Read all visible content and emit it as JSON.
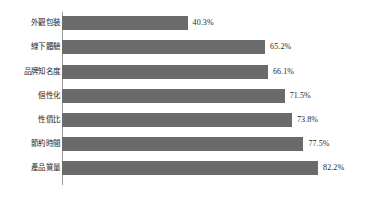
{
  "chart_data": {
    "type": "bar",
    "orientation": "horizontal",
    "title": "",
    "subtitle": "",
    "xlabel": "",
    "ylabel": "",
    "grid": false,
    "legend": null,
    "legend_position": "none",
    "xlim": [
      0,
      100
    ],
    "value_suffix": "%",
    "categories": [
      "外觀包裝",
      "線下體驗",
      "品牌知名度",
      "個性化",
      "性價比",
      "節約時間",
      "產品質量"
    ],
    "values": [
      40.3,
      65.2,
      66.1,
      71.5,
      73.8,
      77.5,
      82.2
    ],
    "value_labels": [
      "40.3%",
      "65.2%",
      "66.1%",
      "71.5%",
      "73.8%",
      "77.5%",
      "82.2%"
    ],
    "colors": {
      "bar": "#6b6b6b",
      "axis": "#9a9a9a",
      "text": "#1f1f1f",
      "background": "#ffffff"
    }
  }
}
